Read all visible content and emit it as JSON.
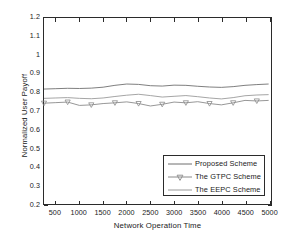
{
  "chart_data": {
    "type": "line",
    "title": "",
    "xlabel": "Network Operation Time",
    "ylabel": "Normalized User Payoff",
    "xlim": [
      250,
      5050
    ],
    "ylim": [
      0.2,
      1.2
    ],
    "grid": false,
    "legend_position": "lower right",
    "x_ticks": [
      500,
      1000,
      1500,
      2000,
      2500,
      3000,
      3500,
      4000,
      4500,
      5000
    ],
    "y_ticks": [
      "0.2",
      "0.3",
      "0.4",
      "0.5",
      "0.6",
      "0.7",
      "0.8",
      "0.9",
      "1",
      "1.1",
      "1.2"
    ],
    "x": [
      250,
      500,
      750,
      1000,
      1250,
      1500,
      1750,
      2000,
      2250,
      2500,
      2750,
      3000,
      3250,
      3500,
      3750,
      4000,
      4250,
      4500,
      4750,
      5000
    ],
    "series": [
      {
        "name": "Proposed Scheme",
        "color": "#6f6f6f",
        "marker": "none",
        "values": [
          0.818,
          0.82,
          0.822,
          0.821,
          0.823,
          0.828,
          0.838,
          0.845,
          0.843,
          0.836,
          0.834,
          0.839,
          0.838,
          0.833,
          0.829,
          0.827,
          0.831,
          0.838,
          0.842,
          0.845
        ]
      },
      {
        "name": "The GTPC Scheme",
        "color": "#8a8a8a",
        "marker": "triangle-down",
        "values": [
          0.742,
          0.745,
          0.748,
          0.73,
          0.733,
          0.74,
          0.744,
          0.749,
          0.74,
          0.727,
          0.736,
          0.748,
          0.744,
          0.75,
          0.74,
          0.733,
          0.744,
          0.757,
          0.754,
          0.757
        ]
      },
      {
        "name": "The EEPC Scheme",
        "color": "#9a9a9a",
        "marker": "none",
        "values": [
          0.768,
          0.77,
          0.772,
          0.768,
          0.766,
          0.77,
          0.778,
          0.785,
          0.79,
          0.783,
          0.775,
          0.779,
          0.783,
          0.777,
          0.77,
          0.765,
          0.772,
          0.782,
          0.786,
          0.788
        ]
      }
    ]
  },
  "legend": {
    "entries": [
      {
        "label": "Proposed Scheme"
      },
      {
        "label": "The GTPC Scheme"
      },
      {
        "label": "The EEPC Scheme"
      }
    ]
  }
}
